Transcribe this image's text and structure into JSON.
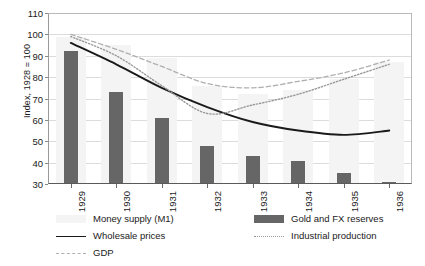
{
  "chart_data": {
    "type": "bar",
    "title": "",
    "subtitle": "",
    "xlabel": "",
    "ylabel": "Index, 1928 = 100",
    "categories": [
      "1929",
      "1930",
      "1931",
      "1932",
      "1933",
      "1934",
      "1935",
      "1936"
    ],
    "ylim": [
      30,
      110
    ],
    "yticks": [
      30,
      40,
      50,
      60,
      70,
      80,
      90,
      100,
      110
    ],
    "grid": true,
    "legend_position": "bottom",
    "series": [
      {
        "name": "Money supply (M1)",
        "kind": "bar",
        "color": "#f4f4f4",
        "values": [
          99,
          95,
          89,
          76,
          72,
          74,
          79,
          87
        ]
      },
      {
        "name": "Gold and FX reserves",
        "kind": "bar",
        "color": "#666666",
        "values": [
          92,
          73,
          61,
          48,
          43,
          41,
          35,
          31
        ]
      },
      {
        "name": "Wholesale prices",
        "kind": "line",
        "style": "solid",
        "color": "#1a1a1a",
        "values": [
          96,
          86,
          75,
          66,
          59,
          55,
          53,
          55
        ]
      },
      {
        "name": "Industrial production",
        "kind": "line",
        "style": "dotted",
        "color": "#9a9a9a",
        "values": [
          99,
          90,
          76,
          63,
          67,
          72,
          79,
          86
        ]
      },
      {
        "name": "GDP",
        "kind": "line",
        "style": "dashed",
        "color": "#b0b0b0",
        "values": [
          100,
          93,
          85,
          77,
          75,
          78,
          82,
          88
        ]
      }
    ]
  },
  "legend": {
    "entries": [
      {
        "label": "Money supply (M1)"
      },
      {
        "label": "Gold and FX reserves"
      },
      {
        "label": "Wholesale prices"
      },
      {
        "label": "Industrial production"
      },
      {
        "label": "GDP"
      }
    ]
  }
}
